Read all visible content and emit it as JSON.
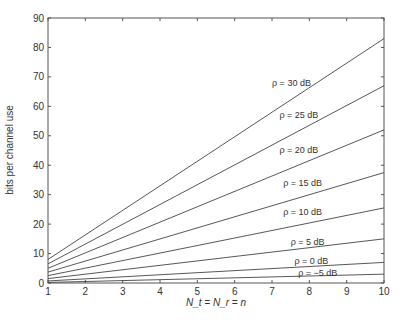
{
  "chart_data": {
    "type": "line",
    "title": "",
    "xlabel": "N_t = N_r = n",
    "ylabel": "bits per channel use",
    "xlim": [
      1,
      10
    ],
    "ylim": [
      0,
      90
    ],
    "grid": false,
    "x_ticks": [
      1,
      2,
      3,
      4,
      5,
      6,
      7,
      8,
      9,
      10
    ],
    "y_ticks": [
      0,
      10,
      20,
      30,
      40,
      50,
      60,
      70,
      80,
      90
    ],
    "x": [
      1,
      10
    ],
    "series": [
      {
        "name": "ρ = 30 dB",
        "values": [
          8,
          83
        ]
      },
      {
        "name": "ρ = 25 dB",
        "values": [
          6.5,
          67
        ]
      },
      {
        "name": "ρ = 20 dB",
        "values": [
          5,
          52
        ]
      },
      {
        "name": "ρ = 15 dB",
        "values": [
          3.7,
          37.5
        ]
      },
      {
        "name": "ρ = 10 dB",
        "values": [
          2.5,
          25.5
        ]
      },
      {
        "name": "ρ = 5 dB",
        "values": [
          1.5,
          15
        ]
      },
      {
        "name": "ρ = 0 dB",
        "values": [
          0.7,
          7
        ]
      },
      {
        "name": "ρ = −5 dB",
        "values": [
          0.2,
          3
        ]
      }
    ],
    "annotations": [
      {
        "text": "ρ = 30 dB",
        "x": 7.0,
        "y": 67
      },
      {
        "text": "ρ = 25 dB",
        "x": 7.2,
        "y": 56
      },
      {
        "text": "ρ = 20 dB",
        "x": 7.2,
        "y": 44
      },
      {
        "text": "ρ = 15 dB",
        "x": 7.3,
        "y": 33
      },
      {
        "text": "ρ = 10 dB",
        "x": 7.3,
        "y": 23
      },
      {
        "text": "ρ = 5 dB",
        "x": 7.5,
        "y": 13
      },
      {
        "text": "ρ = 0 dB",
        "x": 7.6,
        "y": 6.5
      },
      {
        "text": "ρ = −5 dB",
        "x": 7.7,
        "y": 2.5
      }
    ],
    "legend": "none"
  }
}
